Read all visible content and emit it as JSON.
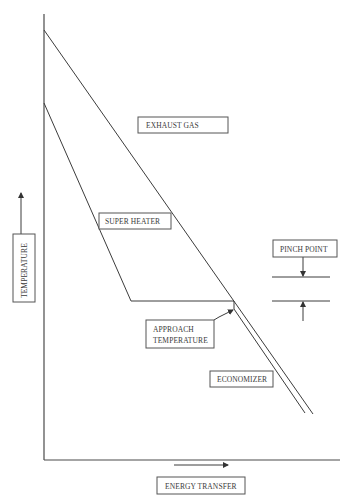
{
  "diagram": {
    "axes": {
      "y_label": "TEMPERATURE",
      "x_label": "ENERGY TRANSFER",
      "y_arrow_direction": "up",
      "x_arrow_direction": "right"
    },
    "labels": {
      "exhaust_gas": "EXHAUST GAS",
      "super_heater": "SUPER HEATER",
      "pinch_point": "PINCH POINT",
      "approach_line1": "APPROACH",
      "approach_line2": "TEMPERATURE",
      "economizer": "ECONOMIZER"
    },
    "curves": [
      {
        "name": "exhaust-gas-line",
        "description": "Straight falling line from top of temperature axis down to the right"
      },
      {
        "name": "water-steam-line",
        "description": "Superheater slope, horizontal evaporator plateau, small step, economizer slope"
      }
    ],
    "colors": {
      "line": "#3c3c3c",
      "box_border": "#555555",
      "text": "#3a3a3a",
      "background": "#ffffff"
    }
  }
}
